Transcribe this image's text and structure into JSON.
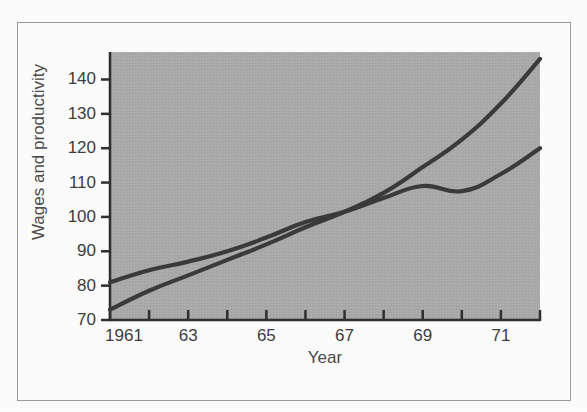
{
  "figure": {
    "background_color": "#fcfcfc",
    "frame_color": "#9a9a9a",
    "plot_background_color": "#a9a9a9",
    "line_color": "#3a3a3a",
    "axis_color": "#2f2f2f"
  },
  "chart_data": {
    "type": "line",
    "title": "",
    "xlabel": "Year",
    "ylabel": "Wages and productivity",
    "xlim": [
      1961,
      1972
    ],
    "ylim": [
      70,
      148
    ],
    "grid": false,
    "legend_position": "inline-annotations",
    "x": [
      1961,
      1962,
      1963,
      1964,
      1965,
      1966,
      1967,
      1968,
      1969,
      1970,
      1971,
      1972
    ],
    "xtick_values": [
      1961,
      1962,
      1963,
      1964,
      1965,
      1966,
      1967,
      1968,
      1969,
      1970,
      1971,
      1972
    ],
    "xtick_labels": [
      "1961",
      "",
      "63",
      "",
      "65",
      "",
      "67",
      "",
      "69",
      "",
      "71",
      ""
    ],
    "ytick_values": [
      70,
      80,
      90,
      100,
      110,
      120,
      130,
      140
    ],
    "ytick_labels": [
      "70",
      "80",
      "90",
      "100",
      "110",
      "120",
      "130",
      "140"
    ],
    "series": [
      {
        "name": "Average gross hourly earnings",
        "label_line1": "Average gross",
        "label_line2": "hourly earnings",
        "values": [
          73,
          78.5,
          83,
          87.5,
          92,
          97,
          101.5,
          107,
          114.5,
          122.5,
          133,
          146
        ]
      },
      {
        "name": "Output per man hour",
        "label_line1": "Output per",
        "label_line2": "man hour",
        "values": [
          81,
          84.5,
          87,
          90,
          94,
          98.5,
          101.5,
          105.5,
          109,
          107.5,
          112.5,
          120
        ]
      }
    ],
    "annotations": [
      {
        "text": "Average gross hourly earnings",
        "x": 1966.1,
        "y": 128
      },
      {
        "text": "Output per man hour",
        "x": 1968.2,
        "y": 102
      }
    ]
  }
}
